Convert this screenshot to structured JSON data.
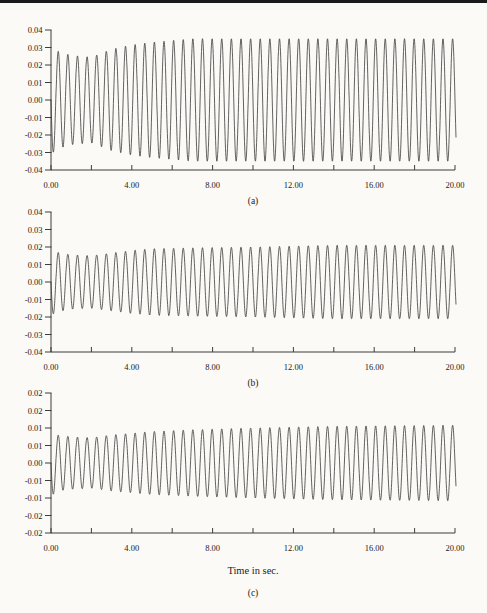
{
  "page": {
    "background_color": "#fbfaf7",
    "top_rule_color": "#1a1a1a",
    "axis_color": "#3d3d3d",
    "curve_color": "#3b3b3b",
    "label_color": "#222222"
  },
  "x_axis_title": "Time in sec.",
  "chart_data": [
    {
      "type": "line",
      "caption": "(a)",
      "xlabel": "",
      "ylabel": "",
      "xlim": [
        0,
        20
      ],
      "ylim": [
        -0.04,
        0.04
      ],
      "x_major_ticks": [
        0,
        4,
        8,
        12,
        16,
        20
      ],
      "x_tick_labels": [
        "0.00",
        "4.00",
        "8.00",
        "12.00",
        "16.00",
        "20.00"
      ],
      "x_minor_ticks": [
        2,
        6,
        10,
        14,
        18
      ],
      "y_ticks": [
        0.04,
        0.03,
        0.02,
        0.01,
        0,
        -0.01,
        -0.02,
        -0.03,
        -0.04
      ],
      "y_tick_labels": [
        "0.04",
        "0.03",
        "0.02",
        "0.01",
        "0.00",
        "-0.01",
        "-0.02",
        "-0.03",
        "-0.04"
      ],
      "grid": false,
      "legend": false,
      "signal": {
        "description": "sinusoid that briefly decays then grows to a steady amplitude",
        "frequency_hz": 2.1,
        "start_value": 0,
        "start_direction": "down",
        "end_time_s": 20,
        "envelope": {
          "t": [
            0,
            0.3,
            1,
            2,
            3,
            4,
            5,
            6,
            7,
            20
          ],
          "amplitude": [
            0.031,
            0.028,
            0.0255,
            0.0245,
            0.029,
            0.0315,
            0.033,
            0.034,
            0.035,
            0.035
          ]
        }
      }
    },
    {
      "type": "line",
      "caption": "(b)",
      "xlabel": "",
      "ylabel": "",
      "xlim": [
        0,
        20
      ],
      "ylim": [
        -0.04,
        0.04
      ],
      "x_major_ticks": [
        0,
        4,
        8,
        12,
        16,
        20
      ],
      "x_tick_labels": [
        "0.00",
        "4.00",
        "8.00",
        "12.00",
        "16.00",
        "20.00"
      ],
      "x_minor_ticks": [
        2,
        6,
        10,
        14,
        18
      ],
      "y_ticks": [
        0.04,
        0.03,
        0.02,
        0.01,
        0,
        -0.01,
        -0.02,
        -0.03,
        -0.04
      ],
      "y_tick_labels": [
        "0.04",
        "0.03",
        "0.02",
        "0.01",
        "0.00",
        "-0.01",
        "-0.02",
        "-0.03",
        "-0.04"
      ],
      "grid": false,
      "legend": false,
      "signal": {
        "description": "sinusoid that briefly decays then grows to a steady amplitude",
        "frequency_hz": 2.1,
        "start_value": 0,
        "start_direction": "down",
        "end_time_s": 20,
        "envelope": {
          "t": [
            0,
            0.3,
            1,
            2,
            3,
            4,
            5,
            7,
            10,
            14,
            20
          ],
          "amplitude": [
            0.019,
            0.017,
            0.0155,
            0.015,
            0.0165,
            0.018,
            0.019,
            0.0195,
            0.02,
            0.021,
            0.021
          ]
        }
      }
    },
    {
      "type": "line",
      "caption": "(c)",
      "xlabel": "Time in sec.",
      "ylabel": "",
      "xlim": [
        0,
        20
      ],
      "ylim": [
        -0.02,
        0.02
      ],
      "x_major_ticks": [
        0,
        4,
        8,
        12,
        16,
        20
      ],
      "x_tick_labels": [
        "0.00",
        "4.00",
        "8.00",
        "12.00",
        "16.00",
        "20.00"
      ],
      "x_minor_ticks": [
        2,
        6,
        10,
        14,
        18
      ],
      "y_ticks": [
        0.02,
        0.015,
        0.01,
        0.005,
        0,
        -0.005,
        -0.01,
        -0.015,
        -0.02
      ],
      "y_tick_labels": [
        "0.02",
        "0.02",
        "0.01",
        "0.01",
        "0.00",
        "-0.01",
        "-0.01",
        "-0.02",
        "-0.02"
      ],
      "grid": false,
      "legend": false,
      "signal": {
        "description": "sinusoid that briefly decays then grows to a steady amplitude",
        "frequency_hz": 2.1,
        "start_value": 0,
        "start_direction": "down",
        "end_time_s": 20,
        "envelope": {
          "t": [
            0,
            0.3,
            1,
            2,
            3,
            4,
            5,
            7,
            10,
            14,
            20
          ],
          "amplitude": [
            0.0095,
            0.008,
            0.0075,
            0.0072,
            0.008,
            0.0085,
            0.009,
            0.0095,
            0.01,
            0.0105,
            0.0108
          ]
        }
      }
    }
  ]
}
